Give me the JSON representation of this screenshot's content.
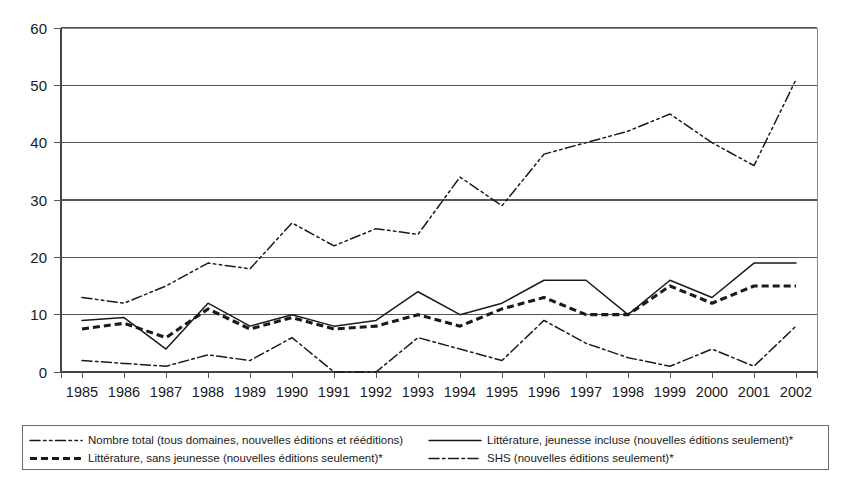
{
  "chart_data": {
    "type": "line",
    "title": "",
    "subtitle": "",
    "xlabel": "",
    "ylabel": "",
    "xlim": [
      1985,
      2002
    ],
    "ylim": [
      0,
      60
    ],
    "yticks": [
      0,
      10,
      20,
      30,
      40,
      50,
      60
    ],
    "grid": true,
    "legend_position": "bottom",
    "categories": [
      1985,
      1986,
      1987,
      1988,
      1989,
      1990,
      1991,
      1992,
      1993,
      1994,
      1995,
      1996,
      1997,
      1998,
      1999,
      2000,
      2001,
      2002
    ],
    "tick_labels": [
      "1985",
      "1986",
      "1987",
      "1988",
      "1989",
      "1990",
      "1991",
      "1992",
      "1993",
      "1994",
      "1995",
      "1996",
      "1997",
      "1998",
      "1999",
      "2000",
      "2001",
      "2002"
    ],
    "ytick_labels": [
      "0",
      "10",
      "20",
      "30",
      "40",
      "50",
      "60"
    ],
    "series": [
      {
        "name": "Nombre total (tous domaines, nouvelles éditions et rééditions)",
        "style": "dash-dot-dot",
        "color": "#1a1a1a",
        "values": [
          13,
          12,
          15,
          19,
          18,
          26,
          22,
          25,
          24,
          34,
          29,
          38,
          40,
          42,
          45,
          40,
          36,
          51
        ]
      },
      {
        "name": "Littérature, jeunesse incluse (nouvelles éditions seulement)*",
        "style": "solid",
        "color": "#1a1a1a",
        "values": [
          9,
          9.5,
          4,
          12,
          8,
          10,
          8,
          9,
          14,
          10,
          12,
          16,
          16,
          10,
          16,
          13,
          19,
          19
        ]
      },
      {
        "name": "Littérature, sans jeunesse (nouvelles éditions seulement)*",
        "style": "dashed",
        "color": "#1a1a1a",
        "values": [
          7.5,
          8.5,
          6,
          11,
          7.5,
          9.5,
          7.5,
          8,
          10,
          8,
          11,
          13,
          10,
          10,
          15,
          12,
          15,
          15
        ]
      },
      {
        "name": "SHS (nouvelles éditions seulement)*",
        "style": "dash-dot",
        "color": "#1a1a1a",
        "values": [
          2,
          1.5,
          1,
          3,
          2,
          6,
          0,
          0,
          6,
          4,
          2,
          9,
          5,
          2.5,
          1,
          4,
          1,
          8
        ]
      }
    ]
  },
  "legend": {
    "entries": [
      {
        "label": "Nombre total (tous domaines, nouvelles éditions et rééditions)",
        "style": "dash-dot-dot",
        "column": "left",
        "row": 0
      },
      {
        "label": "Littérature, sans jeunesse (nouvelles éditions seulement)*",
        "style": "dashed",
        "column": "left",
        "row": 1
      },
      {
        "label": "Littérature, jeunesse incluse (nouvelles éditions seulement)*",
        "style": "solid",
        "column": "right",
        "row": 0
      },
      {
        "label": "SHS (nouvelles éditions seulement)*",
        "style": "dash-dot",
        "column": "right",
        "row": 1
      }
    ]
  },
  "colors": {
    "ink": "#1a1a1a",
    "grid": "#555555",
    "border": "#888888",
    "background": "#ffffff"
  }
}
